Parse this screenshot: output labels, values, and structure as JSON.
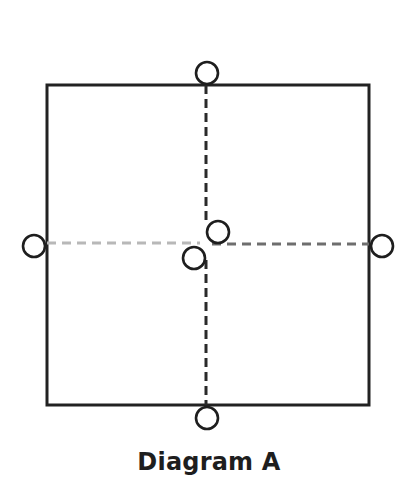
{
  "diagram": {
    "caption": "Diagram A",
    "colors": {
      "stroke": "#222222",
      "dashed_vertical": "#2a2a2a",
      "dashed_horizontal_left": "#b8b8b8",
      "dashed_horizontal_right": "#6e6e6e",
      "background": "#ffffff"
    },
    "square": {
      "x": 47,
      "y": 85,
      "width": 322,
      "height": 320
    },
    "dashed_lines": [
      {
        "name": "vertical-center-line",
        "orientation": "vertical"
      },
      {
        "name": "horizontal-center-line",
        "orientation": "horizontal"
      }
    ],
    "circles": [
      {
        "name": "top-circle",
        "position": "top edge midpoint"
      },
      {
        "name": "bottom-circle",
        "position": "bottom edge midpoint"
      },
      {
        "name": "left-circle",
        "position": "left edge midpoint"
      },
      {
        "name": "right-circle",
        "position": "right edge midpoint"
      },
      {
        "name": "center-upper-right-circle",
        "position": "center, offset up-right"
      },
      {
        "name": "center-lower-left-circle",
        "position": "center, offset down-left"
      }
    ]
  }
}
